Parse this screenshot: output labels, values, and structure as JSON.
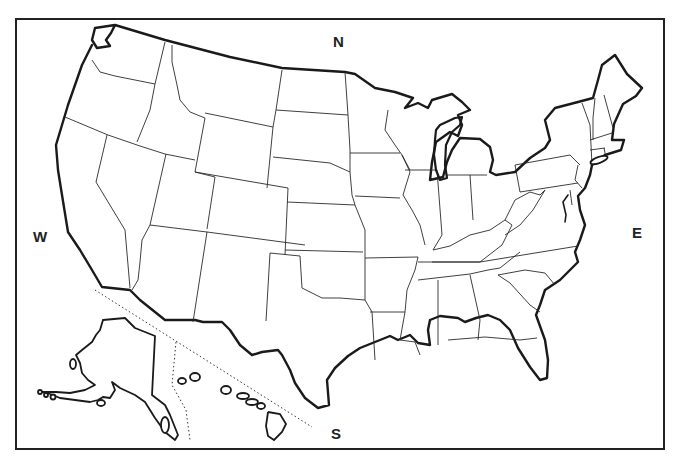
{
  "map": {
    "title": "United States outline map",
    "compass": {
      "north": "N",
      "south": "S",
      "east": "E",
      "west": "W"
    },
    "insets": [
      "Alaska",
      "Hawaii"
    ],
    "style": {
      "background": "#ffffff",
      "stroke": "#222222",
      "fill": "#ffffff"
    },
    "regions": [
      "Washington",
      "Oregon",
      "California",
      "Idaho",
      "Nevada",
      "Montana",
      "Wyoming",
      "Utah",
      "Arizona",
      "Colorado",
      "New Mexico",
      "North Dakota",
      "South Dakota",
      "Nebraska",
      "Kansas",
      "Oklahoma",
      "Texas",
      "Minnesota",
      "Iowa",
      "Missouri",
      "Arkansas",
      "Louisiana",
      "Wisconsin",
      "Illinois",
      "Michigan",
      "Indiana",
      "Ohio",
      "Kentucky",
      "Tennessee",
      "Mississippi",
      "Alabama",
      "Georgia",
      "Florida",
      "South Carolina",
      "North Carolina",
      "Virginia",
      "West Virginia",
      "Maryland",
      "Delaware",
      "Pennsylvania",
      "New Jersey",
      "New York",
      "Connecticut",
      "Rhode Island",
      "Massachusetts",
      "Vermont",
      "New Hampshire",
      "Maine",
      "Alaska",
      "Hawaii"
    ]
  }
}
